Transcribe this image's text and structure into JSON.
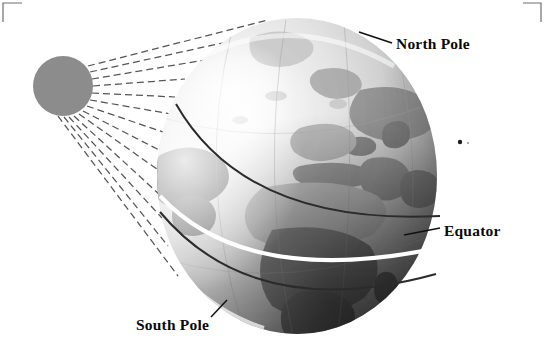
{
  "figure": {
    "background_color": "#ffffff",
    "width": 545,
    "height": 362
  },
  "labels": {
    "north_pole": "North Pole",
    "equator": "Equator",
    "south_pole": "South Pole"
  },
  "sun": {
    "name": "sun",
    "fill_color": "#8c8c8c",
    "center_x": 63,
    "center_y": 86,
    "radius": 30,
    "ray_count": 13,
    "ray_color": "#555555",
    "ray_style": "dashed"
  },
  "globe": {
    "name": "earth-globe",
    "center_x": 297,
    "center_y": 176,
    "radius_x": 140,
    "radius_y": 158,
    "lit_color": "#dedede",
    "shadow_color": "#4a4a4a",
    "land_color": "#7d7d7d"
  },
  "lines": {
    "equator_color": "#ffffff",
    "tropic_color": "#2b2b2b",
    "meridian_color": "#9a9a9a",
    "leader_color": "#111111"
  },
  "corner_marks": {
    "color": "#6e6e6e",
    "top_left": "crop-mark",
    "top_right": "crop-mark"
  },
  "speck": {
    "name": "print-speck",
    "x": 460,
    "y": 142
  }
}
